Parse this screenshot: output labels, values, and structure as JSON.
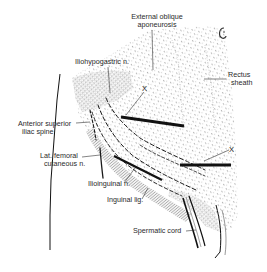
{
  "diagram": {
    "type": "anatomical-illustration",
    "labels": {
      "external_oblique_line1": "External oblique",
      "external_oblique_line2": "aponeurosis",
      "iliohypogastric": "Iliohypogastric n.",
      "rectus_line1": "Rectus",
      "rectus_line2": "sheath",
      "x_upper": "X",
      "asis_line1": "Anterior superior",
      "asis_line2": "iliac spine",
      "lfcn_line1": "Lat. femoral",
      "lfcn_line2": "cutaneous n.",
      "x_lower": "X",
      "ilioinguinal": "Ilioinguinal n.",
      "inguinal_lig": "Inguinal lig.",
      "spermatic_cord": "Spermatic cord"
    },
    "colors": {
      "ink": "#1a1a1a",
      "stipple": "#9a9a9a",
      "background": "#ffffff"
    }
  }
}
